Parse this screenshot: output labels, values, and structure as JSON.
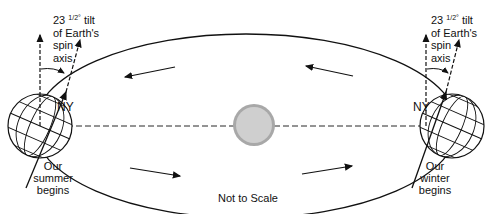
{
  "diagram": {
    "caption": "Not to Scale",
    "left_globe": {
      "tilt_label_number": "23",
      "tilt_label_fraction": "1/2°",
      "tilt_label_rest": " tilt",
      "tilt_line2": "of Earth's",
      "tilt_line3": "spin",
      "tilt_line4": "axis",
      "city": "NY",
      "season_line1": "Our",
      "season_line2": "summer",
      "season_line3": "begins"
    },
    "right_globe": {
      "tilt_label_number": "23",
      "tilt_label_fraction": "1/2°",
      "tilt_label_rest": " tilt",
      "tilt_line2": "of Earth's",
      "tilt_line3": "spin",
      "tilt_line4": "axis",
      "city": "NY",
      "season_line1": "Our",
      "season_line2": "winter",
      "season_line3": "begins"
    },
    "colors": {
      "line": "#111111",
      "sun_fill": "#c8c8c8",
      "sun_edge": "#9a9a9a"
    }
  }
}
